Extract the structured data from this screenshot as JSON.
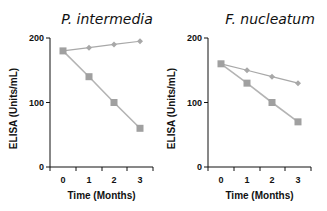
{
  "chart_data": [
    {
      "type": "line",
      "title": "P. intermedia",
      "xlabel": "Time (Months)",
      "ylabel": "ELISA (Units/mL)",
      "x": [
        0,
        1,
        2,
        3
      ],
      "x_ticks": [
        "0",
        "1",
        "2",
        "3"
      ],
      "y_ticks": [
        "0",
        "100",
        "200"
      ],
      "ylim": [
        0,
        200
      ],
      "grid": false,
      "legend": null,
      "series": [
        {
          "name": "diamond-series",
          "marker": "diamond",
          "values": [
            180,
            185,
            190,
            195
          ]
        },
        {
          "name": "square-series",
          "marker": "square",
          "values": [
            180,
            140,
            100,
            60
          ]
        }
      ]
    },
    {
      "type": "line",
      "title": "F. nucleatum",
      "xlabel": "Time (Months)",
      "ylabel": "ELISA (Units/mL)",
      "x": [
        0,
        1,
        2,
        3
      ],
      "x_ticks": [
        "0",
        "1",
        "2",
        "3"
      ],
      "y_ticks": [
        "0",
        "100",
        "200"
      ],
      "ylim": [
        0,
        200
      ],
      "grid": false,
      "legend": null,
      "series": [
        {
          "name": "diamond-series",
          "marker": "diamond",
          "values": [
            160,
            150,
            140,
            130
          ]
        },
        {
          "name": "square-series",
          "marker": "square",
          "values": [
            160,
            130,
            100,
            70
          ]
        }
      ]
    }
  ],
  "colors": {
    "axis": "#111111",
    "diamond_series": "#a8a8a8",
    "square_series": "#a0a0a0",
    "square_line": "#b4b4b4"
  }
}
